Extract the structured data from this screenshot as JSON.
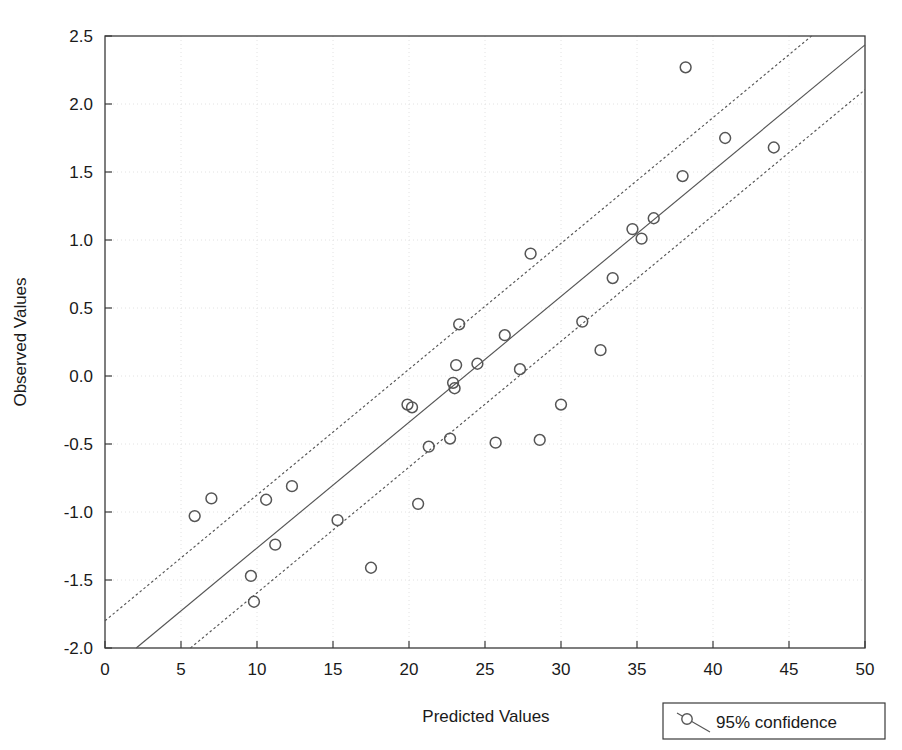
{
  "chart_data": {
    "type": "scatter",
    "title": "",
    "xlabel": "Predicted Values",
    "ylabel": "Observed Values",
    "xlim": [
      0,
      50
    ],
    "ylim": [
      -2.0,
      2.5
    ],
    "xticks": [
      0,
      5,
      10,
      15,
      20,
      25,
      30,
      35,
      40,
      45,
      50
    ],
    "yticks": [
      -2.0,
      -1.5,
      -1.0,
      -0.5,
      0.0,
      0.5,
      1.0,
      1.5,
      2.0,
      2.5
    ],
    "xtick_labels": [
      "0",
      "5",
      "10",
      "15",
      "20",
      "25",
      "30",
      "35",
      "40",
      "45",
      "50"
    ],
    "ytick_labels": [
      "-2.0",
      "-1.5",
      "-1.0",
      "-0.5",
      "0.0",
      "0.5",
      "1.0",
      "1.5",
      "2.0",
      "2.5"
    ],
    "grid": true,
    "grid_style": "dotted",
    "marker": "open-circle",
    "marker_color": "#555555",
    "line_color": "#555555",
    "points": [
      {
        "x": 5.9,
        "y": -1.03
      },
      {
        "x": 7.0,
        "y": -0.9
      },
      {
        "x": 9.6,
        "y": -1.47
      },
      {
        "x": 9.8,
        "y": -1.66
      },
      {
        "x": 10.6,
        "y": -0.91
      },
      {
        "x": 11.2,
        "y": -1.24
      },
      {
        "x": 12.3,
        "y": -0.81
      },
      {
        "x": 15.3,
        "y": -1.06
      },
      {
        "x": 17.5,
        "y": -1.41
      },
      {
        "x": 19.9,
        "y": -0.21
      },
      {
        "x": 20.2,
        "y": -0.23
      },
      {
        "x": 20.6,
        "y": -0.94
      },
      {
        "x": 21.3,
        "y": -0.52
      },
      {
        "x": 22.7,
        "y": -0.46
      },
      {
        "x": 22.9,
        "y": -0.05
      },
      {
        "x": 23.0,
        "y": -0.09
      },
      {
        "x": 23.1,
        "y": 0.08
      },
      {
        "x": 23.3,
        "y": 0.38
      },
      {
        "x": 24.5,
        "y": 0.09
      },
      {
        "x": 25.7,
        "y": -0.49
      },
      {
        "x": 26.3,
        "y": 0.3
      },
      {
        "x": 27.3,
        "y": 0.05
      },
      {
        "x": 28.0,
        "y": 0.9
      },
      {
        "x": 28.6,
        "y": -0.47
      },
      {
        "x": 30.0,
        "y": -0.21
      },
      {
        "x": 31.4,
        "y": 0.4
      },
      {
        "x": 32.6,
        "y": 0.19
      },
      {
        "x": 33.4,
        "y": 0.72
      },
      {
        "x": 34.7,
        "y": 1.08
      },
      {
        "x": 35.3,
        "y": 1.01
      },
      {
        "x": 36.1,
        "y": 1.16
      },
      {
        "x": 38.0,
        "y": 1.47
      },
      {
        "x": 38.2,
        "y": 2.27
      },
      {
        "x": 40.8,
        "y": 1.75
      },
      {
        "x": 44.0,
        "y": 1.68
      }
    ],
    "fit_line": {
      "name": "regression-line",
      "slope": 0.0925,
      "intercept": -2.19,
      "style": "solid"
    },
    "confidence_bands": {
      "label": "95% confidence",
      "upper": {
        "slope": 0.0925,
        "intercept": -1.8,
        "style": "dotted"
      },
      "lower": {
        "slope": 0.0925,
        "intercept": -2.52,
        "style": "dotted"
      }
    }
  },
  "legend": {
    "label": "95% confidence",
    "marker_name": "circle-with-line-marker"
  },
  "colors": {
    "frame": "#3a3a3a",
    "grid": "#e2e2e2",
    "marker": "#555555",
    "line": "#555555",
    "text": "#1a1a1a"
  }
}
